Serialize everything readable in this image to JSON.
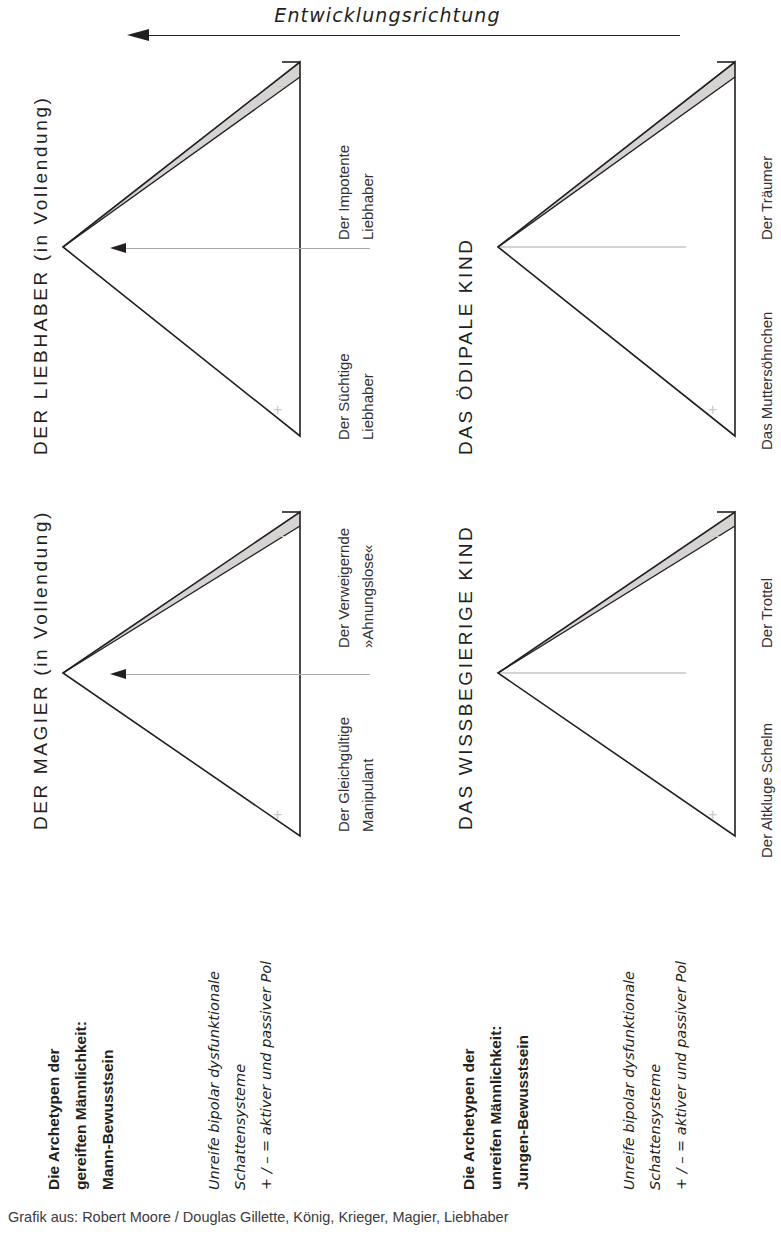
{
  "header": {
    "direction_label": "Entwicklungsrichtung",
    "arrow_icon": "arrow-left-icon",
    "arrow_direction": "left"
  },
  "colors": {
    "ink": "#231f20",
    "shadow_fill": "#d6d4d2",
    "thin_rule": "#a9a7a8",
    "text_grey": "#333034"
  },
  "quadrants": [
    {
      "id": "der-liebhaber",
      "title": "DER LIEBHABER (in Vollendung)",
      "group": "mature",
      "shadow_top": {
        "sign": "–",
        "lines": [
          "Der Impotente",
          "Liebhaber"
        ]
      },
      "shadow_bottom": {
        "sign": "+",
        "lines": [
          "Der Süchtige",
          "Liebhaber"
        ]
      },
      "has_center_arrow": true
    },
    {
      "id": "das-oedipale-kind",
      "title": "DAS ÖDIPALE KIND",
      "group": "immature",
      "shadow_top": {
        "sign": "–",
        "lines": [
          "Der Träumer"
        ]
      },
      "shadow_bottom": {
        "sign": "+",
        "lines": [
          "Das Muttersöhnchen"
        ]
      },
      "has_center_arrow": false
    },
    {
      "id": "der-magier",
      "title": "DER MAGIER (in Vollendung)",
      "group": "mature",
      "shadow_top": {
        "sign": "–",
        "lines": [
          "Der Verweigernde",
          "»Ahnungslose«"
        ]
      },
      "shadow_bottom": {
        "sign": "+",
        "lines": [
          "Der Gleichgültige",
          "Manipulant"
        ]
      },
      "has_center_arrow": true
    },
    {
      "id": "das-wissbegierige-kind",
      "title": "DAS WISSBEGIERIGE KIND",
      "group": "immature",
      "shadow_top": {
        "sign": "–",
        "lines": [
          "Der Trottel"
        ]
      },
      "shadow_bottom": {
        "sign": "+",
        "lines": [
          "Der Altkluge Schelm"
        ]
      },
      "has_center_arrow": false
    }
  ],
  "legends": [
    {
      "id": "legend-mature",
      "heading": [
        "Die Archetypen der",
        "gereiften Männlichkeit:",
        "Mann-Bewusstsein"
      ],
      "notes": [
        "Unreife bipolar dysfunktionale",
        "Schattensysteme",
        "+ / – = aktiver und passiver Pol"
      ]
    },
    {
      "id": "legend-immature",
      "heading": [
        "Die Archetypen der",
        "unreifen Männlichkeit:",
        "Jungen-Bewusstsein"
      ],
      "notes": [
        "Unreife bipolar dysfunktionale",
        "Schattensysteme",
        "+ / – = aktiver und passiver Pol"
      ]
    }
  ],
  "credit": "Grafik aus: Robert Moore / Douglas Gillette, König, Krieger, Magier, Liebhaber"
}
